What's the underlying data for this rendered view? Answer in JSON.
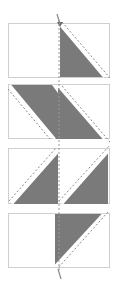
{
  "diagram": {
    "type": "quilt-block-sewing-steps",
    "colors": {
      "background": "#ffffff",
      "border": "#cfcfcf",
      "dark_fabric": "#7a7a7a",
      "stitch_line": "#8a8a8a"
    },
    "steps": [
      {
        "index": 1,
        "label": "",
        "left_half": "empty",
        "right_half": "dark-triangle-lower-left"
      },
      {
        "index": 2,
        "label": "",
        "left_half": "dark-triangle-upper-right",
        "right_half": "dark-triangle-lower-left"
      },
      {
        "index": 3,
        "label": "",
        "left_half": "dark-triangle-lower-right",
        "right_half": "dark-triangle-lower-right"
      },
      {
        "index": 4,
        "label": "",
        "left_half": "empty",
        "right_half": "dark-triangle-upper-left"
      }
    ]
  }
}
